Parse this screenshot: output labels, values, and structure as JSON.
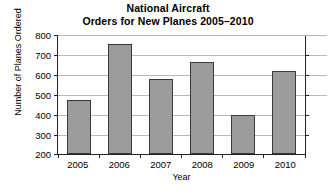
{
  "chart_data": {
    "type": "bar",
    "title_lines": [
      "National Aircraft",
      "Orders for New Planes 2005–2010"
    ],
    "categories": [
      "2005",
      "2006",
      "2007",
      "2008",
      "2009",
      "2010"
    ],
    "values": [
      470,
      750,
      575,
      660,
      395,
      615
    ],
    "xlabel": "Year",
    "ylabel": "Number of Planes Ordered",
    "ylim": [
      200,
      800
    ],
    "ytick_labels": [
      "800",
      "700",
      "600",
      "500",
      "400",
      "300",
      "200"
    ],
    "ytick_values": [
      800,
      700,
      600,
      500,
      400,
      300,
      200
    ],
    "grid": true,
    "legend": false,
    "series_name": "Planes Ordered",
    "colors": {
      "bar_fill": "#9c9c9c",
      "bar_border": "#3a3a3a",
      "gridline": "#b9b9b9",
      "axis": "#222222",
      "background": "#ffffff",
      "text": "#000000"
    }
  }
}
